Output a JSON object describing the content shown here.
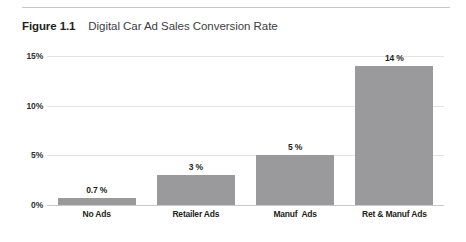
{
  "figure": {
    "label": "Figure 1.1",
    "title": "Digital Car Ad Sales Conversion Rate"
  },
  "colors": {
    "bar_fill": "#9a9a9c",
    "gridline": "#e3e3e5",
    "baseline": "#c9c9cc",
    "rule": "#c9c9cc",
    "text": "#231f20"
  },
  "chart_data": {
    "type": "bar",
    "title": "Digital Car Ad Sales Conversion Rate",
    "xlabel": "",
    "ylabel": "",
    "categories": [
      "No Ads",
      "Retailer Ads",
      "Manuf  Ads",
      "Ret & Manuf Ads"
    ],
    "values": [
      0.7,
      3,
      5,
      14
    ],
    "data_labels": [
      "0.7 %",
      "3 %",
      "5 %",
      "14 %"
    ],
    "ylim": [
      0,
      15
    ],
    "yticks": [
      0,
      5,
      10,
      15
    ],
    "ytick_labels": [
      "0%",
      "5%",
      "10%",
      "15%"
    ],
    "grid": true,
    "legend": false
  }
}
